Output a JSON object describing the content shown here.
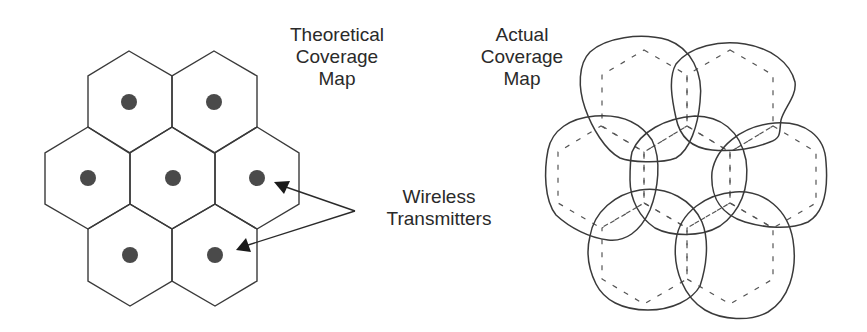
{
  "theoretical": {
    "title_lines": [
      "Theoretical",
      "Coverage",
      "Map"
    ],
    "cell_count": 7,
    "transmitter_count": 7
  },
  "actual": {
    "title_lines": [
      "Actual",
      "Coverage",
      "Map"
    ],
    "coverage_region_count": 7
  },
  "callout": {
    "label_lines": [
      "Wireless",
      "Transmitters"
    ],
    "arrow_count": 2
  },
  "colors": {
    "line": "#3a3a3a",
    "dot": "#4a4a4a",
    "dashed": "#555555",
    "background": "#ffffff"
  }
}
